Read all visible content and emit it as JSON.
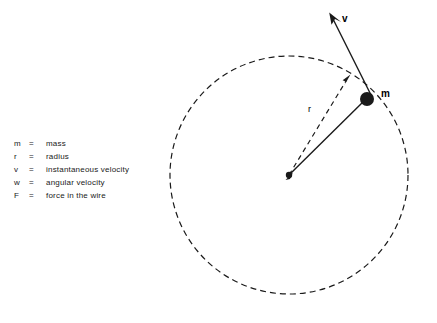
{
  "figure": {
    "background_color": "#ffffff",
    "stroke_color": "#1a1a1a"
  },
  "legend": {
    "rows": [
      {
        "symbol": "m",
        "equals": "=",
        "description": "mass"
      },
      {
        "symbol": "r",
        "equals": "=",
        "description": "radius"
      },
      {
        "symbol": "v",
        "equals": "=",
        "description": "instantaneous velocity"
      },
      {
        "symbol": "w",
        "equals": "=",
        "description": "angular velocity"
      },
      {
        "symbol": "F",
        "equals": "=",
        "description": "force in the wire"
      }
    ]
  },
  "labels": {
    "velocity": "v",
    "radius": "r",
    "mass": "m"
  },
  "geometry": {
    "circle": {
      "cx": 289,
      "cy": 175,
      "r": 119,
      "dash": "6 4"
    },
    "center_dot": {
      "cx": 289,
      "cy": 175,
      "r": 3
    },
    "mass_dot": {
      "cx": 367,
      "cy": 99,
      "r": 7
    },
    "radius_arrow": {
      "x1": 289,
      "y1": 175,
      "x2": 349,
      "y2": 76
    },
    "velocity_arrow": {
      "x1": 372,
      "y1": 96,
      "x2": 330,
      "y2": 14
    },
    "wire_line": {
      "x1": 289,
      "y1": 175,
      "x2": 367,
      "y2": 99
    }
  }
}
